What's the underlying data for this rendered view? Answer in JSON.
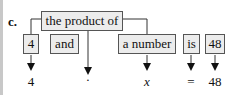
{
  "label": "c.",
  "top_box": "the product of",
  "boxes": [
    "4",
    "and",
    "a number",
    "is",
    "48"
  ],
  "outputs": [
    "4",
    "·",
    "x",
    "=",
    "48"
  ]
}
